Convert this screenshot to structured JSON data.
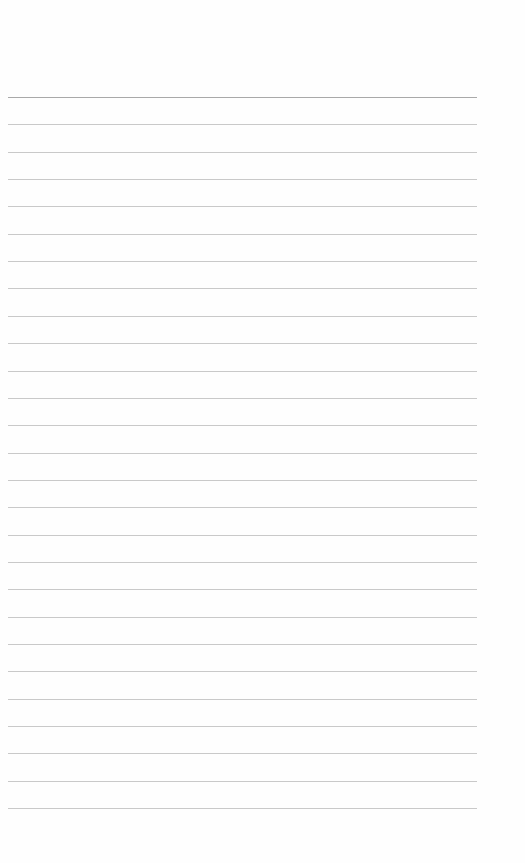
{
  "document": {
    "type": "lined-paper",
    "text": "",
    "rules": {
      "count": 27,
      "first_y": 97,
      "spacing": 27.35,
      "left_x": 8,
      "right_x": 477,
      "color": "#c9c9c9",
      "first_color": "#a9a9a9"
    }
  }
}
